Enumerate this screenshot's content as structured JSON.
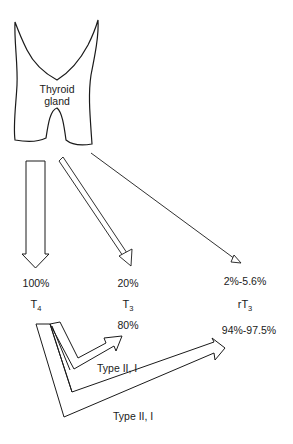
{
  "gland": {
    "line1": "Thyroid",
    "line2": "gland"
  },
  "outputs": [
    {
      "pct": "100%",
      "hormone": "T",
      "sub": "4"
    },
    {
      "pct": "20%",
      "hormone": "T",
      "sub": "3",
      "conv_pct": "80%"
    },
    {
      "pct": "2%-5.6%",
      "hormone": "rT",
      "sub": "3",
      "conv_pct": "94%-97.5%"
    }
  ],
  "conversions": [
    {
      "label": "Type II, I",
      "from": "T4",
      "to": "T3"
    },
    {
      "label": "Type II, I",
      "from": "T4",
      "to": "rT3"
    }
  ],
  "colors": {
    "stroke": "#1a1a1a",
    "fill": "#ffffff"
  }
}
